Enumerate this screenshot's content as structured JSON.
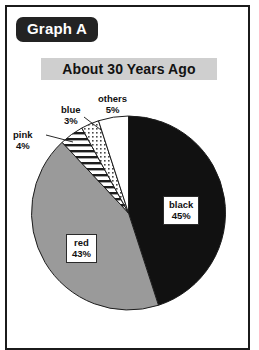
{
  "page": {
    "background_color": "#ffffff",
    "frame_border_color": "#1b1b1b"
  },
  "badge": {
    "label": "Graph A",
    "background_color": "#232323",
    "text_color": "#ffffff"
  },
  "subtitle": {
    "text": "About 30 Years Ago",
    "background_color": "#cfcfcf",
    "text_color": "#121212"
  },
  "chart_data": {
    "type": "pie",
    "title": "About 30 Years Ago",
    "subtitle": "Graph A",
    "xlabel": "",
    "ylabel": "",
    "legend": "none",
    "grid": false,
    "start_angle_deg": 0,
    "direction": "clockwise",
    "categories": [
      "black",
      "red",
      "pink",
      "blue",
      "others"
    ],
    "values": [
      45,
      43,
      4,
      3,
      5
    ],
    "units": "%",
    "slices": [
      {
        "name": "black",
        "value": 45,
        "value_label": "45%",
        "fill": "#111111",
        "pattern": "solid",
        "label_placement": "inside-box"
      },
      {
        "name": "red",
        "value": 43,
        "value_label": "43%",
        "fill": "#9a9a9a",
        "pattern": "solid",
        "label_placement": "inside-box"
      },
      {
        "name": "pink",
        "value": 4,
        "value_label": "4%",
        "fill": "#ffffff",
        "pattern": "horizontal-stripes",
        "label_placement": "outside-leader"
      },
      {
        "name": "blue",
        "value": 3,
        "value_label": "3%",
        "fill": "#ffffff",
        "pattern": "dots",
        "label_placement": "outside-leader"
      },
      {
        "name": "others",
        "value": 5,
        "value_label": "5%",
        "fill": "#ffffff",
        "pattern": "solid",
        "label_placement": "outside"
      }
    ]
  }
}
